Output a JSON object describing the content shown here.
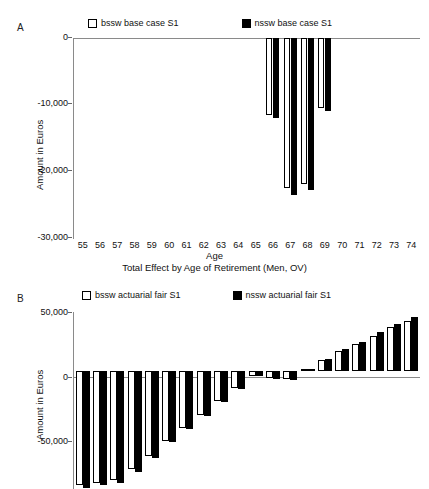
{
  "figure": {
    "panels": [
      {
        "letter": "A",
        "legend": [
          {
            "label": "bssw base case S1",
            "style": "open"
          },
          {
            "label": "nssw base case S1",
            "style": "filled"
          }
        ],
        "ylabel": "Amount in Euros",
        "xlabel": "Age",
        "caption": "Total Effect by Age of Retirement (Men, OV)",
        "yticks": [
          "0",
          "-10,000",
          "-20,000",
          "-30,000"
        ]
      },
      {
        "letter": "B",
        "legend": [
          {
            "label": "bssw actuarial fair S1",
            "style": "open"
          },
          {
            "label": "nssw actuarial fair S1",
            "style": "filled"
          }
        ],
        "ylabel": "Amount in Euros",
        "xlabel": "",
        "caption": "",
        "yticks": [
          "50,000",
          "0",
          "-50,000"
        ]
      }
    ]
  },
  "chart_data": [
    {
      "type": "bar",
      "panel": "A",
      "title": "Total Effect by Age of Retirement (Men, OV)",
      "xlabel": "Age",
      "ylabel": "Amount in Euros",
      "ylim": [
        -30000,
        0
      ],
      "yticks": [
        0,
        -10000,
        -20000,
        -30000
      ],
      "grid": false,
      "legend_position": "top",
      "categories": [
        55,
        56,
        57,
        58,
        59,
        60,
        61,
        62,
        63,
        64,
        65,
        66,
        67,
        68,
        69,
        70,
        71,
        72,
        73,
        74
      ],
      "series": [
        {
          "name": "bssw base case S1",
          "style": "open",
          "values": [
            0,
            0,
            0,
            0,
            0,
            0,
            0,
            0,
            0,
            0,
            0,
            -11500,
            -22400,
            -21800,
            -10400,
            0,
            0,
            0,
            0,
            0
          ]
        },
        {
          "name": "nssw base case S1",
          "style": "filled",
          "values": [
            0,
            0,
            0,
            0,
            0,
            0,
            0,
            0,
            0,
            0,
            0,
            -11900,
            -23400,
            -22700,
            -10900,
            0,
            0,
            0,
            0,
            0
          ]
        }
      ]
    },
    {
      "type": "bar",
      "panel": "B",
      "title": "",
      "xlabel": "",
      "ylabel": "Amount in Euros",
      "ylim": [
        -100000,
        50000
      ],
      "yticks": [
        50000,
        0,
        -50000
      ],
      "grid": false,
      "legend_position": "top",
      "note": "Bars for the most negative ages are clipped by the bottom edge of the image.",
      "categories": [
        55,
        56,
        57,
        58,
        59,
        60,
        61,
        62,
        63,
        64,
        65,
        66,
        67,
        68,
        69,
        70,
        71,
        72,
        73,
        74
      ],
      "series": [
        {
          "name": "bssw actuarial fair S1",
          "style": "open",
          "values": [
            -97000,
            -95000,
            -92000,
            -83000,
            -72000,
            -59000,
            -48000,
            -37000,
            -25000,
            -14000,
            -4000,
            -6000,
            -7000,
            1500,
            9000,
            17000,
            23000,
            30000,
            37000,
            42000
          ]
        },
        {
          "name": "nssw actuarial fair S1",
          "style": "filled",
          "values": [
            -99000,
            -97000,
            -95000,
            -86000,
            -74000,
            -60000,
            -49000,
            -38000,
            -26000,
            -15000,
            -4500,
            -6500,
            -7500,
            2000,
            10500,
            19000,
            25000,
            33000,
            40000,
            46000
          ]
        }
      ]
    }
  ]
}
